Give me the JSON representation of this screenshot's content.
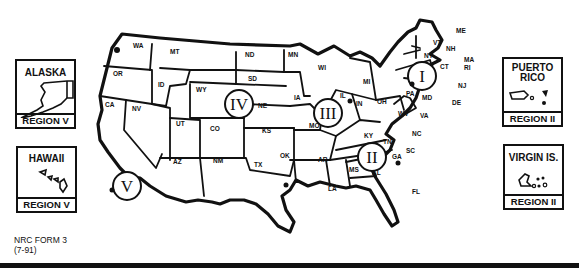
{
  "map": {
    "title": "NRC Regions of the United States",
    "states": [
      "WA",
      "OR",
      "CA",
      "NV",
      "ID",
      "MT",
      "WY",
      "UT",
      "CO",
      "AZ",
      "NM",
      "ND",
      "SD",
      "NE",
      "KS",
      "OK",
      "TX",
      "MN",
      "IA",
      "MO",
      "AR",
      "LA",
      "WI",
      "IL",
      "MI",
      "IN",
      "OH",
      "KY",
      "TN",
      "MS",
      "AL",
      "GA",
      "FL",
      "SC",
      "NC",
      "VA",
      "WV",
      "PA",
      "NY",
      "VT",
      "NH",
      "ME",
      "MA",
      "RI",
      "CT",
      "NJ",
      "DE",
      "MD"
    ],
    "regions": [
      "I",
      "II",
      "III",
      "IV",
      "V"
    ]
  },
  "insets": {
    "alaska": {
      "title": "ALASKA",
      "region": "REGION V"
    },
    "hawaii": {
      "title": "HAWAII",
      "region": "REGION V"
    },
    "puerto_rico": {
      "title_line1": "PUERTO",
      "title_line2": "RICO",
      "region": "REGION II"
    },
    "virgin_islands": {
      "title": "VIRGIN IS.",
      "region": "REGION II"
    }
  },
  "footer": {
    "form_label": "NRC FORM 3",
    "form_date": "(7-91)"
  }
}
